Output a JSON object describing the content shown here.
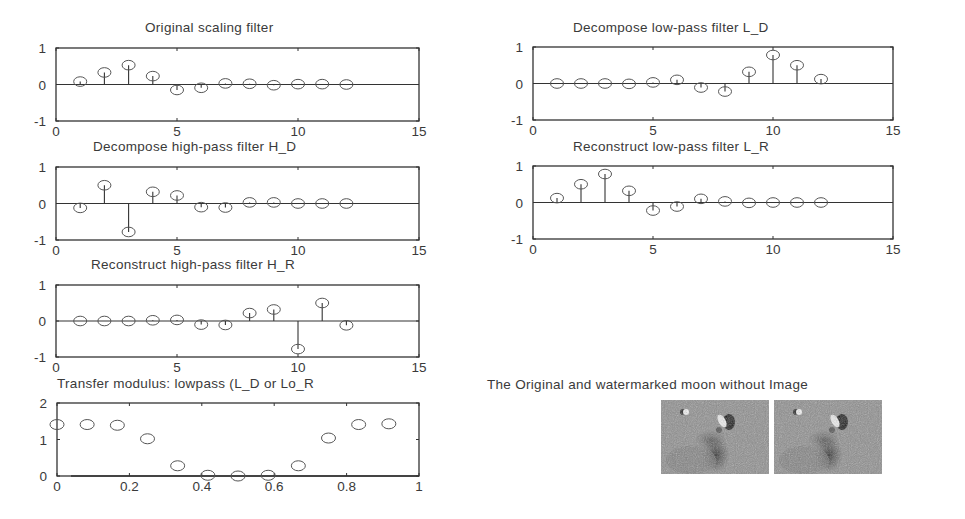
{
  "chart_data": [
    {
      "type": "stem",
      "title": "Original scaling filter",
      "x": [
        1,
        2,
        3,
        4,
        5,
        6,
        7,
        8,
        9,
        10,
        11,
        12
      ],
      "values": [
        0.08,
        0.33,
        0.53,
        0.23,
        -0.15,
        -0.09,
        0.03,
        0.02,
        -0.02,
        0.01,
        0.01,
        0.0
      ],
      "xlim": [
        0,
        15
      ],
      "ylim": [
        -1,
        1
      ],
      "xticks": [
        0,
        5,
        10,
        15
      ],
      "yticks": [
        -1,
        0,
        1
      ],
      "xlabel": "",
      "ylabel": ""
    },
    {
      "type": "stem",
      "title": "Decompose low-pass filter L_D",
      "x": [
        1,
        2,
        3,
        4,
        5,
        6,
        7,
        8,
        9,
        10,
        11,
        12
      ],
      "values": [
        0.0,
        0.0,
        0.0,
        -0.01,
        0.03,
        0.1,
        -0.11,
        -0.22,
        0.32,
        0.78,
        0.5,
        0.12
      ],
      "xlim": [
        0,
        15
      ],
      "ylim": [
        -1,
        1
      ],
      "xticks": [
        0,
        5,
        10,
        15
      ],
      "yticks": [
        -1,
        0,
        1
      ],
      "xlabel": "",
      "ylabel": ""
    },
    {
      "type": "stem",
      "title": "Decompose high-pass filter H_D",
      "x": [
        1,
        2,
        3,
        4,
        5,
        6,
        7,
        8,
        9,
        10,
        11,
        12
      ],
      "values": [
        -0.12,
        0.5,
        -0.78,
        0.32,
        0.22,
        -0.1,
        -0.11,
        0.03,
        0.03,
        0.0,
        0.0,
        0.0
      ],
      "xlim": [
        0,
        15
      ],
      "ylim": [
        -1,
        1
      ],
      "xticks": [
        0,
        5,
        10,
        15
      ],
      "yticks": [
        -1,
        0,
        1
      ],
      "xlabel": "",
      "ylabel": ""
    },
    {
      "type": "stem",
      "title": "Reconstruct low-pass filter L_R",
      "x": [
        1,
        2,
        3,
        4,
        5,
        6,
        7,
        8,
        9,
        10,
        11,
        12
      ],
      "values": [
        0.12,
        0.5,
        0.78,
        0.32,
        -0.22,
        -0.11,
        0.1,
        0.03,
        -0.01,
        0.0,
        0.0,
        0.0
      ],
      "xlim": [
        0,
        15
      ],
      "ylim": [
        -1,
        1
      ],
      "xticks": [
        0,
        5,
        10,
        15
      ],
      "yticks": [
        -1,
        0,
        1
      ],
      "xlabel": "",
      "ylabel": ""
    },
    {
      "type": "stem",
      "title": "Reconstruct high-pass filter H_R",
      "x": [
        1,
        2,
        3,
        4,
        5,
        6,
        7,
        8,
        9,
        10,
        11,
        12
      ],
      "values": [
        0.0,
        0.0,
        0.0,
        0.02,
        0.03,
        -0.1,
        -0.11,
        0.22,
        0.32,
        -0.78,
        0.5,
        -0.12
      ],
      "xlim": [
        0,
        15
      ],
      "ylim": [
        -1,
        1
      ],
      "xticks": [
        0,
        5,
        10,
        15
      ],
      "yticks": [
        -1,
        0,
        1
      ],
      "xlabel": "",
      "ylabel": ""
    },
    {
      "type": "scatter",
      "title": "Transfer modulus: lowpass (L_D or Lo_R",
      "x": [
        0,
        0.0833,
        0.1667,
        0.25,
        0.3333,
        0.4167,
        0.5,
        0.5833,
        0.6667,
        0.75,
        0.8333,
        0.9167
      ],
      "values": [
        1.41,
        1.41,
        1.39,
        1.02,
        0.28,
        0.02,
        0.0,
        0.02,
        0.28,
        1.04,
        1.41,
        1.43
      ],
      "xlim": [
        0,
        1
      ],
      "ylim": [
        0,
        2
      ],
      "xticks": [
        0,
        0.2,
        0.4,
        0.6,
        0.8,
        1
      ],
      "yticks": [
        0,
        1,
        2
      ],
      "xlabel": "",
      "ylabel": ""
    }
  ],
  "figure": {
    "image_panel_title": "The Original and watermarked moon without Image",
    "images": [
      {
        "label": "original-moon"
      },
      {
        "label": "watermarked-moon"
      }
    ]
  },
  "colors": {
    "axis": "#333333",
    "marker": "#555555",
    "text": "#3a3a3a"
  }
}
